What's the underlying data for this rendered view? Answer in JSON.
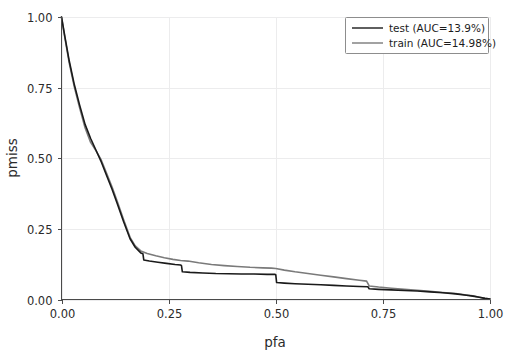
{
  "chart_data": {
    "type": "line",
    "title": "",
    "xlabel": "pfa",
    "ylabel": "pmiss",
    "xlim": [
      0.0,
      1.0
    ],
    "ylim": [
      0.0,
      1.0
    ],
    "grid": true,
    "legend_position": "upper right",
    "xticks": [
      "0.00",
      "0.25",
      "0.50",
      "0.75",
      "1.00"
    ],
    "xtick_values": [
      0.0,
      0.25,
      0.5,
      0.75,
      1.0
    ],
    "yticks": [
      "0.00",
      "0.25",
      "0.50",
      "0.75",
      "1.00"
    ],
    "ytick_values": [
      0.0,
      0.25,
      0.5,
      0.75,
      1.0
    ],
    "series": [
      {
        "name": "test (AUC=13.9%)",
        "label": "test (AUC=13.9%)",
        "color": "#1a1a1a",
        "auc_percent": 13.9,
        "x": [
          0.0,
          0.008,
          0.018,
          0.03,
          0.042,
          0.055,
          0.068,
          0.08,
          0.092,
          0.105,
          0.118,
          0.13,
          0.145,
          0.16,
          0.172,
          0.185,
          0.19,
          0.192,
          0.205,
          0.225,
          0.245,
          0.265,
          0.278,
          0.28,
          0.282,
          0.3,
          0.33,
          0.36,
          0.39,
          0.42,
          0.45,
          0.48,
          0.498,
          0.5,
          0.502,
          0.52,
          0.545,
          0.575,
          0.605,
          0.635,
          0.665,
          0.695,
          0.715,
          0.718,
          0.74,
          0.77,
          0.8,
          0.83,
          0.86,
          0.89,
          0.92,
          0.945,
          0.96,
          0.975,
          0.988,
          1.0
        ],
        "y": [
          1.0,
          0.93,
          0.845,
          0.76,
          0.69,
          0.62,
          0.57,
          0.53,
          0.49,
          0.44,
          0.39,
          0.34,
          0.275,
          0.215,
          0.185,
          0.165,
          0.162,
          0.14,
          0.136,
          0.132,
          0.128,
          0.124,
          0.122,
          0.12,
          0.098,
          0.096,
          0.094,
          0.092,
          0.091,
          0.09,
          0.09,
          0.089,
          0.089,
          0.088,
          0.06,
          0.058,
          0.056,
          0.054,
          0.052,
          0.05,
          0.048,
          0.046,
          0.045,
          0.038,
          0.036,
          0.034,
          0.032,
          0.03,
          0.027,
          0.024,
          0.02,
          0.015,
          0.012,
          0.008,
          0.004,
          0.002
        ]
      },
      {
        "name": "train (AUC=14.98%)",
        "label": "train (AUC=14.98%)",
        "color": "#7a7a7a",
        "auc_percent": 14.98,
        "x": [
          0.0,
          0.008,
          0.018,
          0.03,
          0.042,
          0.055,
          0.068,
          0.08,
          0.092,
          0.105,
          0.118,
          0.13,
          0.145,
          0.16,
          0.172,
          0.185,
          0.2,
          0.22,
          0.24,
          0.26,
          0.278,
          0.295,
          0.32,
          0.35,
          0.38,
          0.41,
          0.44,
          0.47,
          0.49,
          0.5,
          0.52,
          0.545,
          0.575,
          0.605,
          0.635,
          0.665,
          0.695,
          0.712,
          0.718,
          0.74,
          0.77,
          0.8,
          0.83,
          0.86,
          0.89,
          0.92,
          0.945,
          0.96,
          0.975,
          0.988,
          1.0
        ],
        "y": [
          1.0,
          0.925,
          0.838,
          0.752,
          0.68,
          0.608,
          0.556,
          0.528,
          0.496,
          0.448,
          0.398,
          0.348,
          0.282,
          0.22,
          0.19,
          0.172,
          0.163,
          0.155,
          0.148,
          0.142,
          0.138,
          0.136,
          0.13,
          0.124,
          0.12,
          0.117,
          0.114,
          0.112,
          0.111,
          0.11,
          0.104,
          0.098,
          0.092,
          0.086,
          0.08,
          0.074,
          0.068,
          0.065,
          0.048,
          0.044,
          0.04,
          0.036,
          0.033,
          0.029,
          0.025,
          0.021,
          0.016,
          0.013,
          0.008,
          0.004,
          0.002
        ]
      }
    ]
  },
  "axes": {
    "xlabel": "pfa",
    "ylabel": "pmiss"
  },
  "legend": {
    "entries": [
      {
        "label": "test (AUC=13.9%)",
        "color": "#1a1a1a"
      },
      {
        "label": "train (AUC=14.98%)",
        "color": "#7a7a7a"
      }
    ]
  },
  "colors": {
    "test_line": "#1a1a1a",
    "train_line": "#7a7a7a",
    "grid": "#ececed",
    "spine": "#4a4a4a",
    "background": "#ffffff"
  }
}
